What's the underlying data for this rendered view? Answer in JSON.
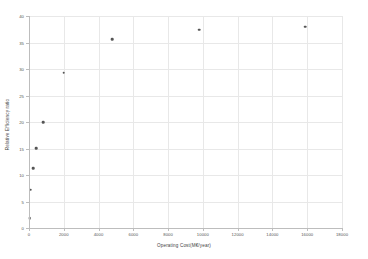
{
  "chart_data": {
    "type": "scatter",
    "title": "",
    "xlabel": "Operating Cost(M€/year)",
    "ylabel": "Relative Efficiency ratio",
    "xlim": [
      0,
      18000
    ],
    "ylim": [
      0,
      40
    ],
    "grid": true,
    "legend": "none",
    "marker_color": "#555555",
    "grid_color": "#e8e8e8",
    "axis_color": "#bdbdbd",
    "xticks": [
      "0",
      "2000",
      "4000",
      "6000",
      "8000",
      "10000",
      "12000",
      "14000",
      "16000",
      "18000"
    ],
    "xtick_values": [
      0,
      2000,
      4000,
      6000,
      8000,
      10000,
      12000,
      14000,
      16000,
      18000
    ],
    "yticks": [
      "0",
      "5",
      "10",
      "15",
      "20",
      "25",
      "30",
      "35",
      "40"
    ],
    "ytick_values": [
      0,
      5,
      10,
      15,
      20,
      25,
      30,
      35,
      40
    ],
    "points": [
      {
        "x": 50,
        "y": 1.9
      },
      {
        "x": 100,
        "y": 7.2
      },
      {
        "x": 250,
        "y": 11.3
      },
      {
        "x": 400,
        "y": 15.1
      },
      {
        "x": 800,
        "y": 20.0
      },
      {
        "x": 2000,
        "y": 29.3
      },
      {
        "x": 4800,
        "y": 35.6
      },
      {
        "x": 9800,
        "y": 37.4
      },
      {
        "x": 15900,
        "y": 38.0
      }
    ]
  }
}
